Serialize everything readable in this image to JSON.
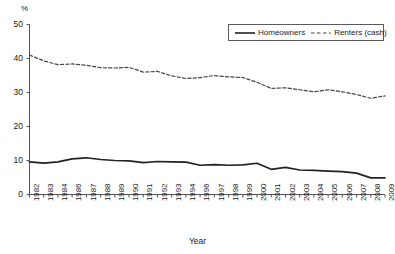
{
  "unit_label": "%",
  "xaxis_title": "Year",
  "legend": {
    "position": "top-right",
    "entries": [
      {
        "label": "Homeowners",
        "style": "solid",
        "color": "#222222"
      },
      {
        "label": "Renters (cash)",
        "style": "dashed",
        "color": "#444444"
      }
    ]
  },
  "chart_data": {
    "type": "line",
    "title": "",
    "subtitle": "",
    "xlabel": "Year",
    "ylabel": "%",
    "ylim": [
      0,
      50
    ],
    "yticks": [
      0,
      10,
      20,
      30,
      40,
      50
    ],
    "grid": false,
    "legend_position": "top-right",
    "categories": [
      "1982",
      "1983",
      "1984",
      "1986",
      "1987",
      "1988",
      "1989",
      "1990",
      "1991",
      "1992",
      "1993",
      "1994",
      "1996",
      "1997",
      "1998",
      "1999",
      "2000",
      "2001",
      "2002",
      "2003",
      "2004",
      "2005",
      "2006",
      "2007",
      "2008",
      "2009"
    ],
    "series": [
      {
        "name": "Homeowners",
        "style": "solid",
        "color": "#222222",
        "values": [
          9.6,
          9.2,
          9.6,
          10.5,
          10.8,
          10.3,
          10.0,
          9.9,
          9.4,
          9.7,
          9.6,
          9.5,
          8.6,
          8.8,
          8.6,
          8.7,
          9.2,
          7.4,
          8.0,
          7.2,
          7.1,
          6.9,
          6.7,
          6.3,
          4.9,
          4.9
        ]
      },
      {
        "name": "Renters (cash)",
        "style": "dashed",
        "color": "#444444",
        "values": [
          41.0,
          39.3,
          38.2,
          38.4,
          38.0,
          37.3,
          37.2,
          37.4,
          36.0,
          36.2,
          34.9,
          34.1,
          34.4,
          35.0,
          34.6,
          34.4,
          33.0,
          31.2,
          31.4,
          30.8,
          30.2,
          30.8,
          30.2,
          29.4,
          28.3,
          29.0
        ]
      }
    ]
  }
}
